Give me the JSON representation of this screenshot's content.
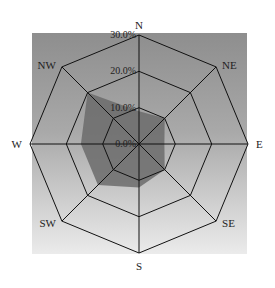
{
  "chart_data": {
    "type": "radar",
    "title": "",
    "subtitle": "",
    "categories": [
      "N",
      "NE",
      "E",
      "SE",
      "S",
      "SW",
      "W",
      "NW"
    ],
    "series": [
      {
        "name": "Wind frequency",
        "values": [
          9,
          10,
          7,
          10,
          12,
          16,
          16,
          20
        ],
        "unit": "%",
        "fill": "#6b6b6b"
      }
    ],
    "radial_axis": {
      "range": [
        0,
        30
      ],
      "ticks": [
        0,
        10,
        20,
        30
      ],
      "tick_labels": [
        "0.0%",
        "10.0%",
        "20.0%",
        "30.0%"
      ]
    },
    "grid": {
      "shape": "octagon",
      "rings": 3,
      "spokes": 8,
      "line_color": "#111111"
    },
    "legend": null,
    "background": {
      "gradient_top": "#8e8e8e",
      "gradient_bottom": "#ebebeb"
    }
  }
}
